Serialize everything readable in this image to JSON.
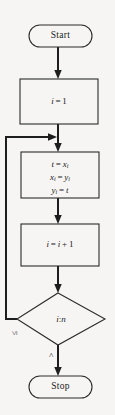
{
  "diagram": {
    "type": "flowchart",
    "background_color": "#f6f5f3",
    "stroke_color": "#1e1e1e",
    "nodes": [
      {
        "id": "start",
        "shape": "terminator",
        "label": "Start"
      },
      {
        "id": "init",
        "shape": "process",
        "label": "i = 1",
        "lines": [
          "i = 1"
        ]
      },
      {
        "id": "swap",
        "shape": "process",
        "label": "t = x_i ; x_i = y_i ; y_i = t",
        "lines": [
          "t = x",
          "x = y",
          "y = t"
        ],
        "line1_lhs": "t",
        "line1_op": "=",
        "line1_rhs_base": "x",
        "line1_rhs_sub": "i",
        "line2_lhs_base": "x",
        "line2_lhs_sub": "i",
        "line2_op": "=",
        "line2_rhs_base": "y",
        "line2_rhs_sub": "i",
        "line3_lhs_base": "y",
        "line3_lhs_sub": "i",
        "line3_op": "=",
        "line3_rhs": "t"
      },
      {
        "id": "increment",
        "shape": "process",
        "label": "i = i + 1",
        "lhs": "i",
        "op1": "=",
        "rhs1": "i",
        "op2": "+",
        "rhs2": "1"
      },
      {
        "id": "decision",
        "shape": "decision",
        "label": "i : n",
        "lhs": "i",
        "separator": ":",
        "rhs": "n"
      },
      {
        "id": "stop",
        "shape": "terminator",
        "label": "Stop"
      }
    ],
    "edges": [
      {
        "from": "start",
        "to": "init",
        "label": ""
      },
      {
        "from": "init",
        "to": "swap",
        "label": ""
      },
      {
        "from": "swap",
        "to": "increment",
        "label": ""
      },
      {
        "from": "increment",
        "to": "decision",
        "label": ""
      },
      {
        "from": "decision",
        "to": "swap",
        "label": "≤"
      },
      {
        "from": "decision",
        "to": "stop",
        "label": ">"
      }
    ],
    "edge_labels": {
      "loop_back": "≤",
      "exit": ">"
    }
  }
}
